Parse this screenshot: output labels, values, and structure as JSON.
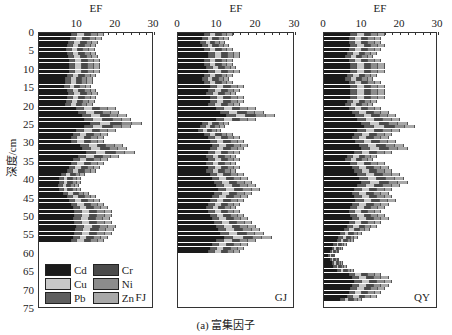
{
  "figure": {
    "caption": "(a) 富集因子",
    "ylabel": "深度/cm",
    "xlabel": "EF"
  },
  "legend": [
    {
      "name": "Cd",
      "color": "#1a1a1a"
    },
    {
      "name": "Cr",
      "color": "#4a4a4a"
    },
    {
      "name": "Cu",
      "color": "#c8c8c8"
    },
    {
      "name": "Ni",
      "color": "#8c8c8c"
    },
    {
      "name": "Pb",
      "color": "#5e5e5e"
    },
    {
      "name": "Zn",
      "color": "#a8a8a8"
    }
  ],
  "panels": [
    {
      "site": "FJ",
      "x_ticks": [
        "10",
        "20",
        "30"
      ],
      "show_zero_tick": false
    },
    {
      "site": "GJ",
      "x_ticks": [
        "0",
        "10",
        "20",
        "30"
      ],
      "show_zero_tick": true
    },
    {
      "site": "QY",
      "x_ticks": [
        "0",
        "10",
        "20",
        "30"
      ],
      "show_zero_tick": true
    }
  ],
  "y_ticks": [
    "0",
    "5",
    "10",
    "15",
    "20",
    "25",
    "30",
    "35",
    "40",
    "45",
    "50",
    "55",
    "60",
    "65",
    "70",
    "75"
  ],
  "chart_data": [
    {
      "type": "bar",
      "orientation": "horizontal-stacked",
      "title": "FJ",
      "xlabel": "EF",
      "ylabel": "深度/cm",
      "xlim": [
        0,
        30
      ],
      "ylim": [
        0,
        75
      ],
      "series_order": [
        "Cd",
        "Pb",
        "Cu",
        "Cr",
        "Ni",
        "Zn"
      ],
      "depths": [
        0,
        1,
        2,
        3,
        4,
        5,
        6,
        7,
        8,
        9,
        10,
        11,
        12,
        13,
        14,
        15,
        16,
        17,
        18,
        19,
        20,
        21,
        22,
        23,
        24,
        25,
        26,
        27,
        28,
        29,
        30,
        31,
        32,
        33,
        34,
        35,
        36,
        37,
        38,
        39,
        40,
        41,
        42,
        43,
        44,
        45,
        46,
        47,
        48,
        49,
        50,
        51,
        52,
        53,
        54,
        55,
        56
      ],
      "totals": [
        17,
        16.5,
        15.5,
        15,
        14.5,
        15,
        15.5,
        16,
        16,
        16,
        16,
        15,
        14,
        14,
        13.5,
        15,
        15.5,
        15,
        14.5,
        14,
        20,
        21,
        23,
        24,
        27,
        24,
        20,
        18,
        17,
        17,
        22,
        23,
        25,
        21,
        18,
        17,
        16,
        15,
        12,
        11,
        11,
        10.5,
        11,
        13,
        15,
        16,
        17,
        18,
        19,
        19,
        18.5,
        19,
        20,
        19.5,
        19,
        18,
        17
      ],
      "cd_fraction": 0.5
    },
    {
      "type": "bar",
      "orientation": "horizontal-stacked",
      "title": "GJ",
      "xlabel": "EF",
      "xlim": [
        0,
        30
      ],
      "ylim": [
        0,
        75
      ],
      "depths": [
        0,
        1,
        2,
        3,
        4,
        5,
        6,
        7,
        8,
        9,
        10,
        11,
        12,
        13,
        14,
        15,
        16,
        17,
        18,
        19,
        20,
        21,
        22,
        23,
        24,
        25,
        26,
        27,
        28,
        29,
        30,
        31,
        32,
        33,
        34,
        35,
        36,
        37,
        38,
        39,
        40,
        41,
        42,
        43,
        44,
        45,
        46,
        47,
        48,
        49,
        50,
        51,
        52,
        53,
        54,
        55,
        56,
        57,
        58,
        59
      ],
      "totals": [
        14,
        13,
        12,
        13,
        14,
        16,
        16,
        14,
        14,
        15,
        16,
        14,
        13,
        14,
        17,
        16,
        15,
        17,
        17,
        16,
        20,
        22,
        25,
        20,
        13,
        12,
        11,
        14,
        16,
        17,
        18,
        17,
        16,
        15,
        16,
        15,
        16,
        15,
        17,
        18,
        19,
        20,
        21,
        19,
        18,
        17,
        16,
        15,
        16,
        17,
        18,
        19,
        20,
        21,
        22,
        24,
        20,
        18,
        17,
        16
      ],
      "cd_fraction": 0.5
    },
    {
      "type": "bar",
      "orientation": "horizontal-stacked",
      "title": "QY",
      "xlabel": "EF",
      "xlim": [
        0,
        30
      ],
      "ylim": [
        0,
        75
      ],
      "depths": [
        0,
        1,
        2,
        3,
        4,
        5,
        6,
        7,
        8,
        9,
        10,
        11,
        12,
        13,
        14,
        15,
        16,
        17,
        18,
        19,
        20,
        21,
        22,
        23,
        24,
        25,
        26,
        27,
        28,
        29,
        30,
        31,
        32,
        33,
        34,
        35,
        36,
        37,
        38,
        39,
        40,
        41,
        42,
        43,
        44,
        45,
        46,
        47,
        48,
        49,
        50,
        51,
        52,
        53,
        54,
        55,
        56,
        57,
        58,
        59,
        60,
        61,
        62,
        63,
        64,
        65,
        66,
        67,
        68,
        69,
        70,
        71,
        72
      ],
      "totals": [
        16,
        15,
        15,
        16,
        15,
        14,
        13,
        15,
        16,
        16,
        16,
        14,
        13,
        15,
        16,
        16,
        16,
        16,
        14,
        13,
        15,
        17,
        19,
        20,
        22,
        24,
        20,
        18,
        17,
        19,
        21,
        22,
        18,
        14,
        13,
        16,
        17,
        18,
        20,
        21,
        22,
        20,
        18,
        17,
        18,
        19,
        17,
        16,
        15,
        16,
        17,
        15,
        14,
        12,
        10,
        9,
        8,
        6,
        5,
        4,
        3,
        4,
        5,
        6,
        8,
        15,
        17,
        18,
        17,
        16,
        15,
        14,
        10
      ],
      "cd_fraction": 0.45
    }
  ]
}
